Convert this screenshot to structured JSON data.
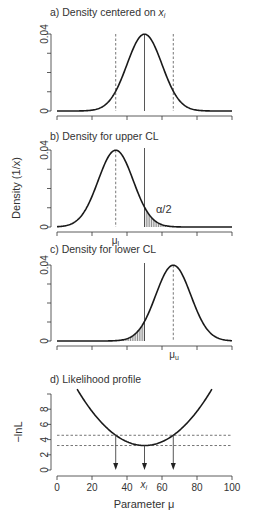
{
  "chart_data": [
    {
      "type": "line",
      "panel": "a",
      "title": "a) Density centered on x_i",
      "title_text": "a) Density centered on ",
      "title_var": "x",
      "title_sub": "i",
      "xlabel": "",
      "ylabel": "",
      "xlim": [
        0,
        100
      ],
      "ylim": [
        0,
        0.04
      ],
      "yticks": [
        "0",
        "0.04"
      ],
      "distribution": {
        "family": "normal",
        "mean": 50,
        "sd": 10
      },
      "vlines": [
        {
          "x": 50,
          "style": "solid"
        },
        {
          "x": 33.55,
          "style": "dashed"
        },
        {
          "x": 66.45,
          "style": "dashed"
        }
      ]
    },
    {
      "type": "line",
      "panel": "b",
      "title": "b) Density for upper CL",
      "xlim": [
        0,
        100
      ],
      "ylim": [
        0,
        0.04
      ],
      "yticks": [
        "0",
        "0.04"
      ],
      "distribution": {
        "family": "normal",
        "mean": 33.55,
        "sd": 10
      },
      "vlines": [
        {
          "x": 33.55,
          "style": "dashed"
        },
        {
          "x": 50,
          "style": "solid"
        }
      ],
      "shaded_region": {
        "from": 50,
        "to": 100,
        "label": "α/2"
      },
      "annotation_below_axis": {
        "text": "μ",
        "sub": "l",
        "x": 33.55
      }
    },
    {
      "type": "line",
      "panel": "c",
      "title": "c) Density for lower CL",
      "xlim": [
        0,
        100
      ],
      "ylim": [
        0,
        0.04
      ],
      "yticks": [
        "0",
        "0.04"
      ],
      "distribution": {
        "family": "normal",
        "mean": 66.45,
        "sd": 10
      },
      "vlines": [
        {
          "x": 66.45,
          "style": "dashed"
        },
        {
          "x": 50,
          "style": "solid"
        }
      ],
      "shaded_region": {
        "from": 0,
        "to": 50
      },
      "annotation_below_axis": {
        "text": "μ",
        "sub": "u",
        "x": 66.45
      }
    },
    {
      "type": "line",
      "panel": "d",
      "title": "d) Likelihood profile",
      "xlabel": "Parameter μ",
      "ylabel": "−lnL",
      "xlim": [
        0,
        100
      ],
      "ylim": [
        0,
        10
      ],
      "xticks": [
        0,
        20,
        40,
        60,
        80,
        100
      ],
      "yticks": [
        0,
        2,
        4,
        6,
        8
      ],
      "curve": {
        "formula": "3.22 + (mu-50)^2/200",
        "x_range": [
          11.5,
          88.5
        ]
      },
      "hlines": [
        3.22,
        4.57
      ],
      "arrows_down_at": [
        33.55,
        50,
        66.45
      ],
      "annotation_below_axis": {
        "text": "x",
        "sub": "i",
        "x": 50
      }
    }
  ],
  "shared_ylabel": "Density (1/x)",
  "alpha_label": "α/2"
}
